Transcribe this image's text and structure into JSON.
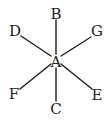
{
  "diagram": {
    "type": "star-of-lines",
    "center": {
      "label": "A",
      "x": 56,
      "y": 62
    },
    "rays": [
      {
        "label": "B",
        "direction": "up",
        "line": [
          56,
          54,
          56,
          20
        ],
        "text_pos": [
          56,
          19
        ]
      },
      {
        "label": "G",
        "direction": "up-right",
        "line": [
          61,
          56,
          91,
          37
        ],
        "text_pos": [
          97,
          36
        ]
      },
      {
        "label": "E",
        "direction": "down-right",
        "line": [
          61,
          64,
          92,
          89
        ],
        "text_pos": [
          97,
          100
        ]
      },
      {
        "label": "C",
        "direction": "down",
        "line": [
          56,
          68,
          56,
          101
        ],
        "text_pos": [
          56,
          114
        ]
      },
      {
        "label": "F",
        "direction": "down-left",
        "line": [
          51,
          64,
          20,
          89
        ],
        "text_pos": [
          14,
          99
        ]
      },
      {
        "label": "D",
        "direction": "up-left",
        "line": [
          51,
          56,
          21,
          36
        ],
        "text_pos": [
          15,
          36
        ]
      }
    ],
    "colors": {
      "line": "#1a1a1a",
      "text": "#222222",
      "background": "#ffffff"
    }
  }
}
